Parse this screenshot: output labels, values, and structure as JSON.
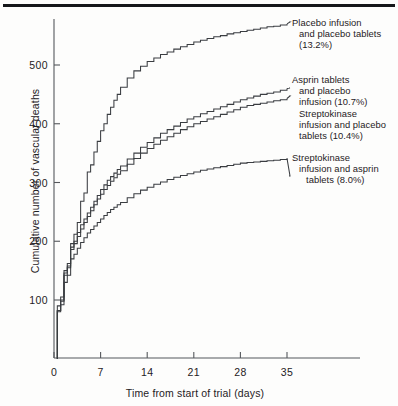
{
  "figure": {
    "background": "#fdfdfc",
    "line_color": "#3a3d41",
    "axis_color": "#55585c",
    "rule_color": "#15171a"
  },
  "axes": {
    "ylabel": "Cumulative number of vascular deaths",
    "xlabel": "Time from start of trial (days)",
    "yticks": [
      "100",
      "200",
      "300",
      "400",
      "500"
    ],
    "xticks": [
      "0",
      "7",
      "14",
      "21",
      "28",
      "35"
    ]
  },
  "legend": {
    "placebo": {
      "line1": "Placebo infusion",
      "line2": "and placebo tablets",
      "line3": "(13.2%)"
    },
    "aspirin": {
      "line1": "Asprin tablets",
      "line2": "and placebo",
      "line3": "infusion (10.7%)",
      "line4": "Streptokinase",
      "line5": "infusion and placebo",
      "line6": "tablets (10.4%)"
    },
    "combined": {
      "line1": "Streptokinase",
      "line2": "infusion and asprin",
      "line3": "tablets (8.0%)"
    }
  },
  "chart_data": {
    "type": "line",
    "title": "",
    "xlabel": "Time from start of trial (days)",
    "ylabel": "Cumulative number of vascular deaths",
    "xlim": [
      0,
      36
    ],
    "ylim": [
      0,
      580
    ],
    "xticks": [
      0,
      7,
      14,
      21,
      28,
      35
    ],
    "yticks": [
      100,
      200,
      300,
      400,
      500
    ],
    "grid": false,
    "legend_position": "right-annotations",
    "step_style": "post",
    "series": [
      {
        "name": "Placebo infusion and placebo tablets (13.2%)",
        "final_percent": 13.2,
        "x": [
          0.5,
          1,
          1.5,
          2,
          2.5,
          3,
          3.5,
          4,
          4.5,
          5,
          5.5,
          6,
          6.5,
          7,
          7.5,
          8,
          8.5,
          9,
          9.5,
          10,
          11,
          12,
          13,
          14,
          15,
          16,
          17,
          18,
          19,
          20,
          21,
          22,
          23,
          24,
          25,
          26,
          27,
          28,
          29,
          30,
          31,
          32,
          33,
          34,
          35
        ],
        "values": [
          90,
          105,
          150,
          162,
          196,
          212,
          232,
          268,
          282,
          318,
          330,
          352,
          370,
          388,
          400,
          416,
          428,
          440,
          450,
          462,
          478,
          490,
          498,
          506,
          512,
          518,
          522,
          527,
          531,
          535,
          539,
          542,
          545,
          548,
          550,
          553,
          555,
          557,
          559,
          561,
          563,
          565,
          566,
          568,
          570
        ]
      },
      {
        "name": "Asprin tablets and placebo infusion (10.7%)",
        "final_percent": 10.7,
        "x": [
          0.5,
          1,
          1.5,
          2,
          2.5,
          3,
          3.5,
          4,
          4.5,
          5,
          5.5,
          6,
          6.5,
          7,
          7.5,
          8,
          8.5,
          9,
          9.5,
          10,
          11,
          12,
          13,
          14,
          15,
          16,
          17,
          18,
          19,
          20,
          21,
          22,
          23,
          24,
          25,
          26,
          27,
          28,
          29,
          30,
          31,
          32,
          33,
          34,
          35
        ],
        "values": [
          82,
          100,
          146,
          158,
          190,
          200,
          215,
          228,
          238,
          248,
          258,
          268,
          278,
          288,
          296,
          304,
          310,
          316,
          322,
          328,
          340,
          350,
          360,
          368,
          376,
          384,
          390,
          396,
          402,
          408,
          412,
          417,
          421,
          425,
          429,
          433,
          437,
          441,
          444,
          447,
          450,
          452,
          454,
          457,
          460
        ]
      },
      {
        "name": "Streptokinase infusion and placebo tablets (10.4%)",
        "final_percent": 10.4,
        "x": [
          0.5,
          1,
          1.5,
          2,
          2.5,
          3,
          3.5,
          4,
          4.5,
          5,
          5.5,
          6,
          6.5,
          7,
          7.5,
          8,
          8.5,
          9,
          9.5,
          10,
          11,
          12,
          13,
          14,
          15,
          16,
          17,
          18,
          19,
          20,
          21,
          22,
          23,
          24,
          25,
          26,
          27,
          28,
          29,
          30,
          31,
          32,
          33,
          34,
          35
        ],
        "values": [
          82,
          98,
          142,
          155,
          186,
          196,
          208,
          221,
          232,
          242,
          252,
          262,
          272,
          280,
          288,
          295,
          302,
          308,
          314,
          320,
          331,
          341,
          350,
          358,
          365,
          372,
          378,
          384,
          390,
          395,
          400,
          404,
          408,
          412,
          416,
          420,
          424,
          428,
          431,
          433,
          435,
          437,
          439,
          441,
          443
        ]
      },
      {
        "name": "Streptokinase infusion and asprin tablets (8.0%)",
        "final_percent": 8.0,
        "x": [
          0.5,
          1,
          1.5,
          2,
          2.5,
          3,
          3.5,
          4,
          4.5,
          5,
          5.5,
          6,
          6.5,
          7,
          7.5,
          8,
          8.5,
          9,
          9.5,
          10,
          11,
          12,
          13,
          14,
          15,
          16,
          17,
          18,
          19,
          20,
          21,
          22,
          23,
          24,
          25,
          26,
          27,
          28,
          29,
          30,
          31,
          32,
          33,
          34,
          35
        ],
        "values": [
          80,
          92,
          130,
          142,
          170,
          178,
          188,
          198,
          206,
          214,
          220,
          226,
          232,
          238,
          244,
          249,
          254,
          258,
          262,
          266,
          274,
          281,
          287,
          292,
          297,
          301,
          305,
          309,
          312,
          315,
          318,
          321,
          323,
          325,
          327,
          329,
          331,
          333,
          334,
          335,
          336,
          337,
          338,
          339,
          341
        ]
      }
    ]
  }
}
